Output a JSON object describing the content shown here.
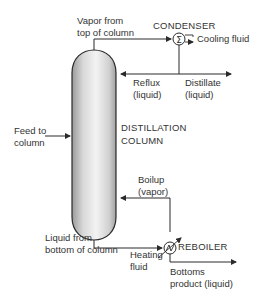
{
  "diagram": {
    "column": {
      "label_line1": "DISTILLATION",
      "label_line2": "COLUMN"
    },
    "condenser": {
      "label": "CONDENSER",
      "symbol": "Σ"
    },
    "reboiler": {
      "label": "REBOILER"
    },
    "streams": {
      "vapor_top": {
        "line1": "Vapor from",
        "line2": "top of column"
      },
      "cooling_fluid": {
        "label": "Cooling fluid"
      },
      "reflux": {
        "line1": "Reflux",
        "line2": "(liquid)"
      },
      "distillate": {
        "line1": "Distillate",
        "line2": "(liquid)"
      },
      "feed": {
        "line1": "Feed to",
        "line2": "column"
      },
      "boilup": {
        "line1": "Boilup",
        "line2": "(vapor)"
      },
      "liquid_bottom": {
        "line1": "Liquid from",
        "line2": "bottom of column"
      },
      "heating_fluid": {
        "line1": "Heating",
        "line2": "fluid"
      },
      "bottoms": {
        "line1": "Bottoms",
        "line2": "product (liquid)"
      }
    },
    "colors": {
      "line": "#2a2a2a",
      "column_light": "#f2f2f2",
      "column_dark": "#a8a8a8"
    }
  }
}
